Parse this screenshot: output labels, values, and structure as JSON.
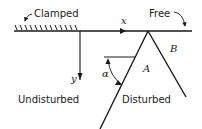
{
  "diagram": {
    "labels": {
      "clamped": "Clamped",
      "free": "Free",
      "x_axis": "x",
      "y_axis": "y",
      "region_a": "A",
      "region_b": "B",
      "angle": "α",
      "undisturbed": "Undisturbed",
      "disturbed": "Disturbed"
    },
    "colors": {
      "ink": "#1a1a1a",
      "background": "#ffffff"
    }
  }
}
